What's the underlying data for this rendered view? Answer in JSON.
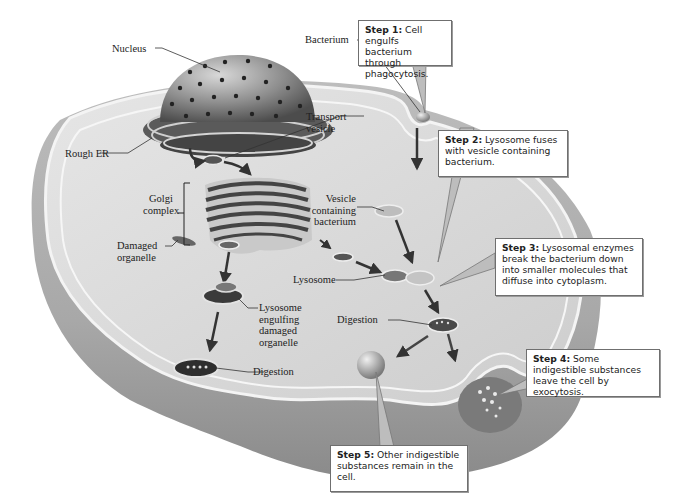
{
  "diagram": {
    "colors": {
      "cell_body": "#cfcfcf",
      "cell_surface": "#dcdcdc",
      "membrane_edge": "#f2f2f2",
      "organelle_dark": "#3a3a3a",
      "arrow": "#3b3b3b",
      "callout_border": "#6f6f6f",
      "callout_fill": "#ffffff"
    },
    "labels": {
      "nucleus": "Nucleus",
      "rough_er": "Rough ER",
      "bacterium": "Bacterium",
      "transport_vesicle_1": "Transport",
      "transport_vesicle_2": "vesicle",
      "golgi_1": "Golgi",
      "golgi_2": "complex",
      "vesicle_bact_1": "Vesicle",
      "vesicle_bact_2": "containing",
      "vesicle_bact_3": "bacterium",
      "damaged_1": "Damaged",
      "damaged_2": "organelle",
      "lysosome": "Lysosome",
      "digestion_right": "Digestion",
      "engulf_1": "Lysosome",
      "engulf_2": "engulfing",
      "engulf_3": "damaged",
      "engulf_4": "organelle",
      "digestion_left": "Digestion"
    },
    "steps": [
      {
        "title": "Step 1:",
        "text": " Cell engulfs bacterium through phagocytosis."
      },
      {
        "title": "Step 2:",
        "text": " Lysosome fuses with vesicle containing bacterium."
      },
      {
        "title": "Step 3:",
        "text": " Lysosomal enzymes break the bacterium down into smaller molecules that diffuse into cytoplasm."
      },
      {
        "title": "Step 4:",
        "text": " Some indigestible substances leave the cell by exocytosis."
      },
      {
        "title": "Step 5:",
        "text": " Other indigestible substances remain in the cell."
      }
    ]
  }
}
